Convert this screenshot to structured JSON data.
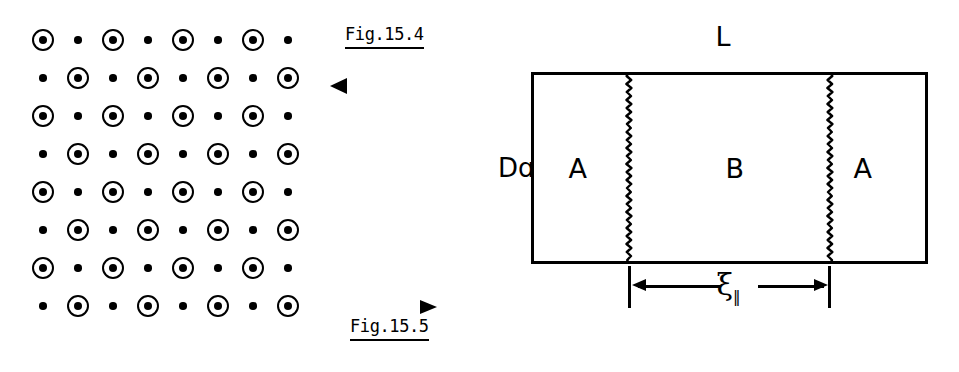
{
  "figure_left": {
    "name": "Fig.15.4",
    "caption": "Fig.15.4",
    "description": "Two-dimensional lattice of alternating circled sites and plain dot sites",
    "arrow_left": "◄",
    "lattice": {
      "columns": 8,
      "rows": 8,
      "x_start": 43,
      "y_start": 40,
      "x_step": 35,
      "y_step": 38,
      "pattern": "checkerboard",
      "site_kinds": [
        "ringed-dot",
        "plain-dot"
      ],
      "grid": [
        [
          "ringed-dot",
          "plain-dot",
          "ringed-dot",
          "plain-dot",
          "ringed-dot",
          "plain-dot",
          "ringed-dot",
          "plain-dot"
        ],
        [
          "plain-dot",
          "ringed-dot",
          "plain-dot",
          "ringed-dot",
          "plain-dot",
          "ringed-dot",
          "plain-dot",
          "ringed-dot"
        ],
        [
          "ringed-dot",
          "plain-dot",
          "ringed-dot",
          "plain-dot",
          "ringed-dot",
          "plain-dot",
          "ringed-dot",
          "plain-dot"
        ],
        [
          "plain-dot",
          "ringed-dot",
          "plain-dot",
          "ringed-dot",
          "plain-dot",
          "ringed-dot",
          "plain-dot",
          "ringed-dot"
        ],
        [
          "ringed-dot",
          "plain-dot",
          "ringed-dot",
          "plain-dot",
          "ringed-dot",
          "plain-dot",
          "ringed-dot",
          "plain-dot"
        ],
        [
          "plain-dot",
          "ringed-dot",
          "plain-dot",
          "ringed-dot",
          "plain-dot",
          "ringed-dot",
          "plain-dot",
          "ringed-dot"
        ],
        [
          "ringed-dot",
          "plain-dot",
          "ringed-dot",
          "plain-dot",
          "ringed-dot",
          "plain-dot",
          "ringed-dot",
          "plain-dot"
        ],
        [
          "plain-dot",
          "ringed-dot",
          "plain-dot",
          "ringed-dot",
          "plain-dot",
          "ringed-dot",
          "plain-dot",
          "ringed-dot"
        ]
      ]
    }
  },
  "figure_right": {
    "name": "Fig.15.5",
    "caption": "Fig.15.5",
    "arrow_right": "►",
    "top_label": "L",
    "side_label": "Dɑ",
    "regions": [
      {
        "label": "A"
      },
      {
        "label": "B"
      },
      {
        "label": "A"
      }
    ],
    "interfaces": [
      {
        "kind": "wavy-line"
      },
      {
        "kind": "wavy-line"
      }
    ],
    "dimension": {
      "symbol": "ξ",
      "subscript": "‖",
      "style": "double-headed-inward-arrow"
    }
  },
  "colors": {
    "ink": "#000000",
    "paper": "#ffffff"
  }
}
